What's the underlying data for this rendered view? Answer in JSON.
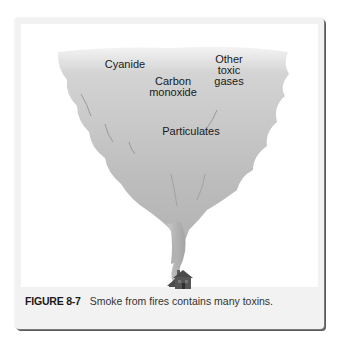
{
  "figure": {
    "number_label": "FIGURE 8-7",
    "caption_text": "Smoke from fires contains many toxins.",
    "labels": {
      "cyanide": "Cyanide",
      "carbon_monoxide": "Carbon\nmonoxide",
      "other_toxic_gases": "Other\ntoxic\ngases",
      "particulates": "Particulates"
    },
    "colors": {
      "smoke_light": "#ebebeb",
      "smoke_mid": "#c4c4c4",
      "smoke_dark": "#a9a9a9",
      "house": "#4d4d4d",
      "frame_bg": "#f2f2f2"
    }
  }
}
